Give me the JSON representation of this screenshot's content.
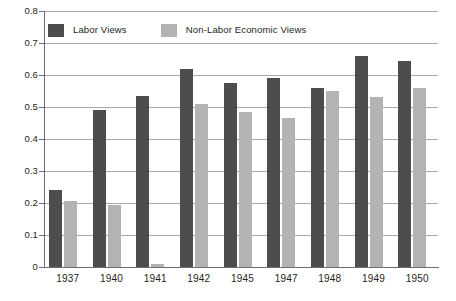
{
  "chart_data": {
    "type": "bar",
    "title": "",
    "xlabel": "",
    "ylabel": "",
    "categories": [
      "1937",
      "1940",
      "1941",
      "1942",
      "1945",
      "1947",
      "1948",
      "1949",
      "1950"
    ],
    "series": [
      {
        "name": "Labor Views",
        "color": "#4d4d4f",
        "values": [
          0.24,
          0.49,
          0.535,
          0.62,
          0.575,
          0.59,
          0.56,
          0.66,
          0.645
        ]
      },
      {
        "name": "Non-Labor Economic Views",
        "color": "#b1b3b5",
        "values": [
          0.205,
          0.195,
          0.008,
          0.51,
          0.485,
          0.465,
          0.55,
          0.53,
          0.56
        ]
      }
    ],
    "ylim": [
      0,
      0.8
    ],
    "ytick_labels": [
      "0.8",
      "0.7",
      "0.6",
      "0.5",
      "0.4",
      "0.3",
      "0.2",
      "0.1",
      "0"
    ],
    "ytick_values": [
      0.8,
      0.7,
      0.6,
      0.5,
      0.4,
      0.3,
      0.2,
      0.1,
      0
    ],
    "grid": "horizontal",
    "legend_position": "top-left-inside"
  },
  "legend": {
    "items": [
      {
        "label": "Labor Views",
        "color": "#4d4d4f"
      },
      {
        "label": "Non-Labor Economic Views",
        "color": "#b1b3b5"
      }
    ]
  }
}
